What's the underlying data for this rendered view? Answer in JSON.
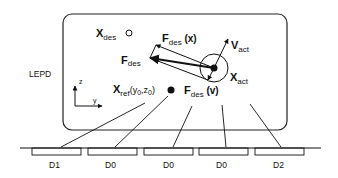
{
  "diagram": {
    "box_label": "LEPD",
    "x_des": {
      "main": "X",
      "sub": "des"
    },
    "f_des": {
      "main": "F",
      "sub": "des"
    },
    "f_des_x": {
      "main": "F",
      "sub": "des",
      "suffix": " (x)"
    },
    "f_des_v": {
      "main": "F",
      "sub": "des",
      "suffix": " (v)"
    },
    "v_act": {
      "main": "V",
      "sub": "act"
    },
    "x_act": {
      "main": "X",
      "sub": "act"
    },
    "x_ref": {
      "main": "X",
      "sub": "ref",
      "args": "(y",
      "arg1sub": "0",
      "comma": ",z",
      "arg2sub": "0",
      "close": ")"
    },
    "axis_z": "z",
    "axis_y": "y",
    "segments": [
      {
        "label": "D1"
      },
      {
        "label": "D0"
      },
      {
        "label": "D0"
      },
      {
        "label": "D0"
      },
      {
        "label": "D2"
      }
    ]
  }
}
